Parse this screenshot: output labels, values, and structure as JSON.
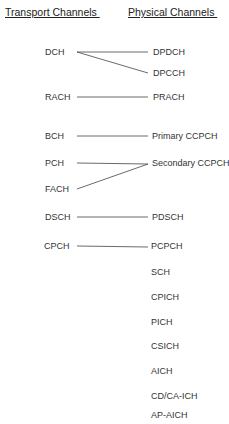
{
  "headers": {
    "transport": "Transport Channels ",
    "physical": "Physical Channels "
  },
  "transport_channels": [
    {
      "label": "DCH",
      "x": 45,
      "y": 52
    },
    {
      "label": "RACH",
      "x": 45,
      "y": 97
    },
    {
      "label": "BCH",
      "x": 45,
      "y": 136
    },
    {
      "label": "PCH",
      "x": 45,
      "y": 163
    },
    {
      "label": "FACH",
      "x": 45,
      "y": 189
    },
    {
      "label": "DSCH",
      "x": 45,
      "y": 217
    },
    {
      "label": "CPCH",
      "x": 45,
      "y": 246
    }
  ],
  "physical_channels": [
    {
      "label": "DPDCH",
      "y": 53
    },
    {
      "label": "DPCCH",
      "y": 73
    },
    {
      "label": "PRACH",
      "y": 97
    },
    {
      "label": "Primary CCPCH",
      "y": 136
    },
    {
      "label": "Secondary CCPCH",
      "y": 163
    },
    {
      "label": "PDSCH",
      "y": 217
    },
    {
      "label": "PCPCH",
      "y": 246
    },
    {
      "label": "SCH",
      "y": 272
    },
    {
      "label": "CPICH",
      "y": 297
    },
    {
      "label": "PICH",
      "y": 322
    },
    {
      "label": "CSICH",
      "y": 346
    },
    {
      "label": "AICH",
      "y": 371
    },
    {
      "label": "CD/CA-ICH",
      "y": 396
    },
    {
      "label": "AP-AICH",
      "y": 415
    }
  ],
  "mappings": [
    {
      "from": "DCH",
      "to": "DPDCH"
    },
    {
      "from": "DCH",
      "to": "DPCCH"
    },
    {
      "from": "RACH",
      "to": "PRACH"
    },
    {
      "from": "BCH",
      "to": "Primary CCPCH"
    },
    {
      "from": "PCH",
      "to": "Secondary CCPCH"
    },
    {
      "from": "FACH",
      "to": "Secondary CCPCH"
    },
    {
      "from": "DSCH",
      "to": "PDSCH"
    },
    {
      "from": "CPCH",
      "to": "PCPCH"
    }
  ]
}
